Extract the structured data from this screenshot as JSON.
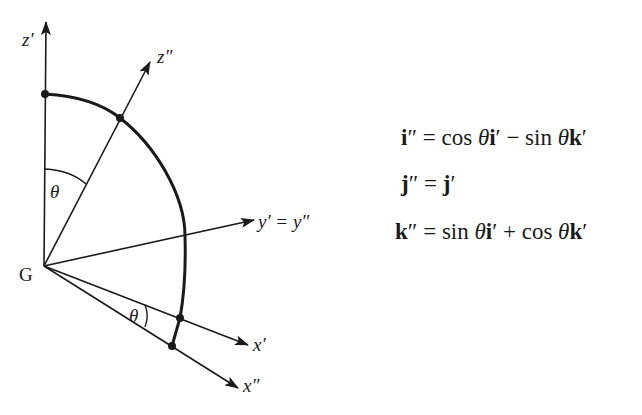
{
  "diagram": {
    "origin_label": "G",
    "axes": [
      {
        "id": "z_prime",
        "label": "z′"
      },
      {
        "id": "z_dprime",
        "label": "z″"
      },
      {
        "id": "y",
        "label": "y′ = y″"
      },
      {
        "id": "x_prime",
        "label": "x′"
      },
      {
        "id": "x_dprime",
        "label": "x″"
      }
    ],
    "angle_labels": [
      "θ",
      "θ"
    ]
  },
  "equations": [
    {
      "lhs": "i″",
      "rhs": "cos θi′ − sin θk′"
    },
    {
      "lhs": "j″",
      "rhs": "j′"
    },
    {
      "lhs": "k″",
      "rhs": "sin θi′ + cos θk′"
    }
  ],
  "eq_parts": {
    "e1": {
      "lhs_b": "i",
      "lhs_p": "″",
      "eq": " = ",
      "t1": "cos ",
      "th1": "θ",
      "b1": "i",
      "p1": "′",
      "op": " − ",
      "t2": "sin ",
      "th2": "θ",
      "b2": "k",
      "p2": "′"
    },
    "e2": {
      "lhs_b": "j",
      "lhs_p": "″",
      "eq": " = ",
      "b1": "j",
      "p1": "′"
    },
    "e3": {
      "lhs_b": "k",
      "lhs_p": "″",
      "eq": " = ",
      "t1": "sin ",
      "th1": "θ",
      "b1": "i",
      "p1": "′",
      "op": " + ",
      "t2": "cos ",
      "th2": "θ",
      "b2": "k",
      "p2": "′"
    }
  }
}
